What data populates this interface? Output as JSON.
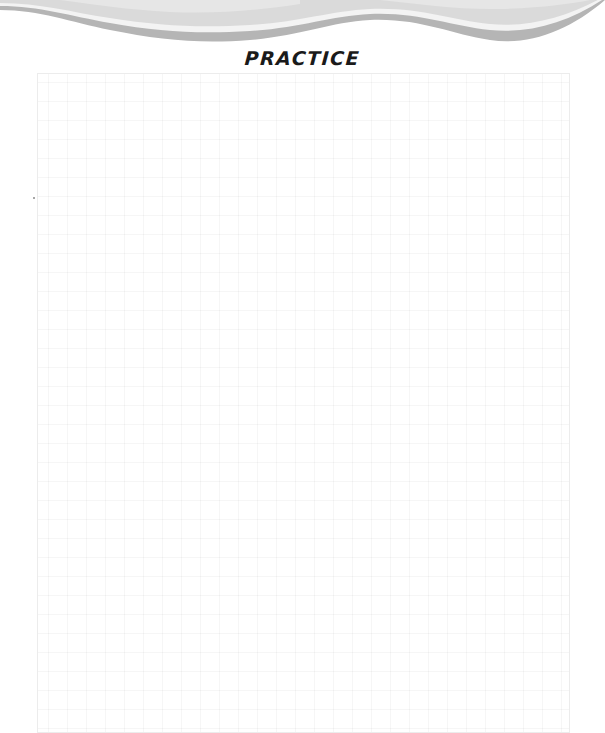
{
  "header": {
    "decoration": "wave-banner",
    "colors": {
      "light_band": "#d9d9d9",
      "highlight": "#f4f4f4",
      "dark_band": "#b3b3b3"
    }
  },
  "title": "PRACTICE",
  "practice_area": {
    "type": "grid-paper",
    "grid_spacing_px": 19,
    "grid_color": "#f2f2f2",
    "border_color": "#ececec"
  }
}
